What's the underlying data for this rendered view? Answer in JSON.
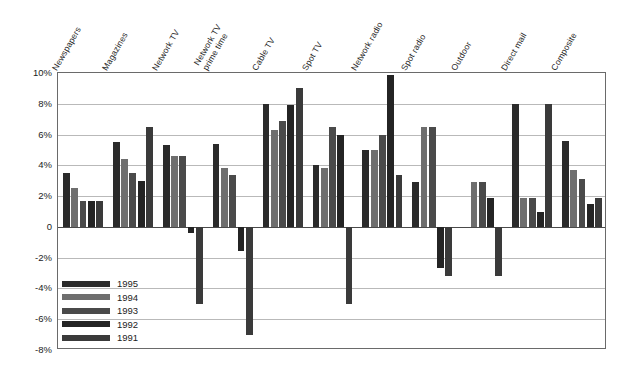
{
  "chart_data": {
    "type": "bar",
    "title": "",
    "xlabel": "",
    "ylabel": "",
    "ylim": [
      -8,
      10
    ],
    "ytick_step": 2,
    "grid": true,
    "legend_position": "lower-left-inside",
    "ytick_labels": [
      "10%",
      "8%",
      "6%",
      "4%",
      "2%",
      "0",
      "-2%",
      "-4%",
      "-6%",
      "-8%"
    ],
    "ytick_values": [
      10,
      8,
      6,
      4,
      2,
      0,
      -2,
      -4,
      -6,
      -8
    ],
    "categories": [
      "Newspapers",
      "Magazines",
      "Network TV",
      "Network TV prime time",
      "Cable TV",
      "Spot TV",
      "Network radio",
      "Spot radio",
      "Outdoor",
      "Direct mail",
      "Composite"
    ],
    "category_lines": [
      [
        "Newspapers"
      ],
      [
        "Magazines"
      ],
      [
        "Network TV"
      ],
      [
        "Network TV",
        "prime time"
      ],
      [
        "Cable TV"
      ],
      [
        "Spot TV"
      ],
      [
        "Network radio"
      ],
      [
        "Spot radio"
      ],
      [
        "Outdoor"
      ],
      [
        "Direct mail"
      ],
      [
        "Composite"
      ]
    ],
    "series": [
      {
        "name": "1995",
        "color": "#2b2b2b",
        "values": [
          3.5,
          5.5,
          5.3,
          5.4,
          8.0,
          4.0,
          5.0,
          2.9,
          0.0,
          8.0,
          5.6
        ]
      },
      {
        "name": "1994",
        "color": "#6e6e6e",
        "values": [
          2.5,
          4.4,
          4.6,
          3.8,
          6.3,
          3.8,
          5.0,
          6.5,
          2.9,
          1.9,
          3.7
        ]
      },
      {
        "name": "1993",
        "color": "#4a4a4a",
        "values": [
          1.7,
          3.5,
          4.6,
          3.4,
          6.9,
          6.5,
          6.0,
          6.5,
          2.9,
          1.9,
          3.1
        ]
      },
      {
        "name": "1992",
        "color": "#242424",
        "values": [
          1.7,
          3.0,
          -0.4,
          -1.6,
          7.9,
          6.0,
          9.9,
          -2.7,
          1.9,
          1.0,
          1.5
        ]
      },
      {
        "name": "1991",
        "color": "#3a3a3a",
        "values": [
          1.7,
          6.5,
          -5.0,
          -7.0,
          9.0,
          -5.0,
          3.4,
          -3.2,
          -3.2,
          8.0,
          1.9
        ]
      }
    ]
  },
  "legend": {
    "entries": [
      {
        "label": "1995",
        "color": "#2b2b2b"
      },
      {
        "label": "1994",
        "color": "#6e6e6e"
      },
      {
        "label": "1993",
        "color": "#4a4a4a"
      },
      {
        "label": "1992",
        "color": "#242424"
      },
      {
        "label": "1991",
        "color": "#3a3a3a"
      }
    ]
  },
  "colors": {
    "axis": "#6a6a6a",
    "grid": "#b9b9b9",
    "zero_line": "#4a4a4a",
    "text": "#1c1c1c",
    "background": "#ffffff"
  }
}
